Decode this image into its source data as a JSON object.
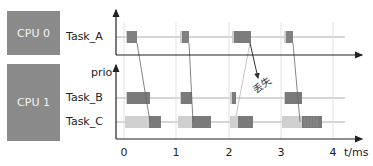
{
  "cpus": [
    {
      "label": "CPU 0"
    },
    {
      "label": "CPU 1"
    }
  ],
  "tasks": {
    "a": "Task_A",
    "b": "Task_B",
    "c": "Task_C"
  },
  "axis": {
    "prio_label": "prio",
    "time_label": "t/ms",
    "ticks": [
      "0",
      "1",
      "2",
      "3",
      "4"
    ]
  },
  "annotation": {
    "lost_label": "丢失"
  },
  "colors": {
    "cpu_box": "#8a8a8a",
    "block_dark": "#7f7f7f",
    "block_light": "#cfcfcf",
    "lane": "#d6d6d6",
    "axis": "#222222"
  }
}
